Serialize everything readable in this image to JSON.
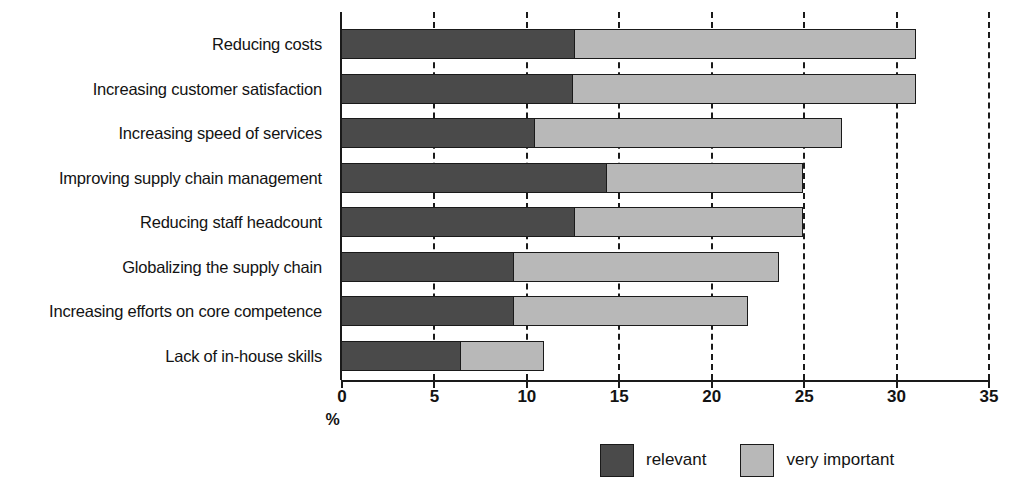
{
  "chart_data": {
    "type": "bar",
    "orientation": "horizontal",
    "stacked": true,
    "title": "",
    "xlabel": "%",
    "ylabel": "",
    "xlim": [
      0,
      35
    ],
    "xticks": [
      0,
      5,
      10,
      15,
      20,
      25,
      30,
      35
    ],
    "xtick_labels": [
      "0",
      "5",
      "10",
      "15",
      "20",
      "25",
      "30",
      "35"
    ],
    "grid": "vertical-dashed",
    "legend_position": "bottom-right",
    "categories": [
      "Reducing costs",
      "Increasing customer satisfaction",
      "Increasing speed of services",
      "Improving supply chain management",
      "Reducing staff headcount",
      "Globalizing the supply chain",
      "Increasing efforts on core competence",
      "Lack of in-house skills"
    ],
    "series": [
      {
        "name": "relevant",
        "color": "#4a4a4a",
        "values": [
          12.7,
          12.6,
          10.5,
          14.4,
          12.7,
          9.4,
          9.4,
          6.5
        ]
      },
      {
        "name": "very important",
        "color": "#b8b8b8",
        "values": [
          18.4,
          18.5,
          16.6,
          10.6,
          12.3,
          14.3,
          12.6,
          4.5
        ]
      }
    ],
    "totals": [
      31.1,
      31.1,
      27.1,
      25.0,
      25.0,
      23.7,
      22.0,
      11.0
    ]
  },
  "legend": {
    "items": [
      {
        "label": "relevant",
        "swatch": "relevant"
      },
      {
        "label": "very important",
        "swatch": "very-important"
      }
    ]
  }
}
